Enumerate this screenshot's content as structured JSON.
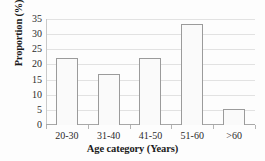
{
  "chart_data": {
    "type": "bar",
    "title": "",
    "subtitle": "",
    "xlabel": "Age category (Years)",
    "ylabel": "Proportion (%)",
    "categories": [
      "20-30",
      "31-40",
      "41-50",
      "51-60",
      ">60"
    ],
    "values": [
      22.2,
      16.7,
      22.2,
      33.3,
      5.3
    ],
    "series": [
      {
        "name": "Proportion",
        "values": [
          22.2,
          16.7,
          22.2,
          33.3,
          5.3
        ]
      }
    ],
    "ylim": [
      0,
      35
    ],
    "ytick_values": [
      0,
      5,
      10,
      15,
      20,
      25,
      30,
      35
    ],
    "ytick_labels": [
      "0",
      "5",
      "10",
      "15",
      "20",
      "25",
      "30",
      "35"
    ],
    "grid": "horizontal",
    "legend": "none",
    "annotations": [],
    "colors": {
      "bar_fill": "#fafafa",
      "bar_border": "#9b9b9b",
      "gridline": "#e2e2e2",
      "axis": "#a8a8a8",
      "text": "#1a1a1a",
      "background": "#fdfdfd"
    }
  }
}
